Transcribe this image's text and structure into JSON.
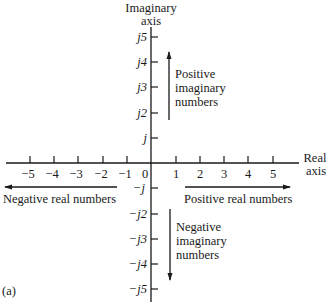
{
  "figure": {
    "panel_label": "(a)",
    "imaginary_axis": {
      "title_line1": "Imaginary",
      "title_line2": "axis",
      "positive_ticks": [
        "j5",
        "j4",
        "j3",
        "j2",
        "j"
      ],
      "negative_ticks": [
        "−j",
        "−j2",
        "−j3",
        "−j4",
        "−j5"
      ]
    },
    "real_axis": {
      "title_line1": "Real",
      "title_line2": "axis",
      "negative_ticks": [
        "−5",
        "−4",
        "−3",
        "−2",
        "−1"
      ],
      "origin": "0",
      "positive_ticks": [
        "1",
        "2",
        "3",
        "4",
        "5"
      ]
    },
    "annotations": {
      "positive_imaginary": [
        "Positive",
        "imaginary",
        "numbers"
      ],
      "negative_imaginary": [
        "Negative",
        "imaginary",
        "numbers"
      ],
      "positive_real": "Positive real numbers",
      "negative_real": "Negative real numbers"
    },
    "colors": {
      "ink": "#1a1a1a",
      "background": "#ffffff"
    }
  }
}
